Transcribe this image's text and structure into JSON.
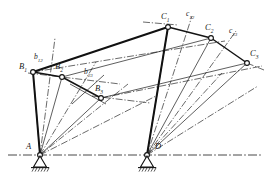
{
  "figure": {
    "background_color": "#ffffff",
    "ink_color": "#1a1a1a",
    "width": 266,
    "height": 179
  },
  "labels": {
    "A": "A",
    "D": "D",
    "B1": "B",
    "B1_sub": "1",
    "B2": "B",
    "B2_sub": "2",
    "B3": "B",
    "B3_sub": "3",
    "C1": "C",
    "C1_sub": "1",
    "C2": "C",
    "C2_sub": "2",
    "C3": "C",
    "C3_sub": "3",
    "b12": "b",
    "b12_sub": "12",
    "b23": "b",
    "b23_sub": "23",
    "c12": "c",
    "c12_sub": "12",
    "c23": "c",
    "c23_sub": "23"
  },
  "nodes": {
    "A": {
      "x": 40,
      "y": 155,
      "type": "ground-pivot"
    },
    "D": {
      "x": 147,
      "y": 155,
      "type": "ground-pivot"
    },
    "B1": {
      "x": 33,
      "y": 72,
      "type": "moving-pin"
    },
    "B2": {
      "x": 62,
      "y": 77,
      "type": "moving-pin"
    },
    "B3": {
      "x": 101,
      "y": 98,
      "type": "moving-pin"
    },
    "C1": {
      "x": 168,
      "y": 27,
      "type": "moving-pin"
    },
    "C2": {
      "x": 211,
      "y": 38,
      "type": "moving-pin"
    },
    "C3": {
      "x": 247,
      "y": 63,
      "type": "moving-pin"
    }
  },
  "coupler_links": [
    {
      "name": "coupler-1",
      "from": "B1",
      "to": "C1"
    },
    {
      "name": "coupler-2",
      "from": "B2",
      "to": "C2"
    },
    {
      "name": "coupler-3",
      "from": "B3",
      "to": "C3"
    }
  ],
  "crank_links": [
    {
      "name": "crank-A-B1",
      "from": "A",
      "to": "B1"
    },
    {
      "name": "crank-A-B2",
      "from": "A",
      "to": "B2"
    },
    {
      "name": "crank-A-B3",
      "from": "A",
      "to": "B3"
    },
    {
      "name": "rocker-D-C1",
      "from": "D",
      "to": "C1"
    },
    {
      "name": "rocker-D-C2",
      "from": "D",
      "to": "C2"
    },
    {
      "name": "rocker-D-C3",
      "from": "D",
      "to": "C3"
    }
  ],
  "bisectors": {
    "b12_label_pos": {
      "x": 38,
      "y": 56
    },
    "b23_label_pos": {
      "x": 87,
      "y": 70
    },
    "c12_label_pos": {
      "x": 188,
      "y": 13
    },
    "c23_label_pos": {
      "x": 231,
      "y": 30
    }
  },
  "ground_line": {
    "y": 155,
    "from_x": 8,
    "to_x": 262,
    "style": "dash-dot"
  }
}
